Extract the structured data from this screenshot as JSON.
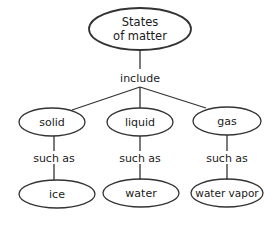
{
  "diagram": {
    "root": {
      "label_line1": "States",
      "label_line2": "of matter"
    },
    "root_link": "include",
    "categories": [
      {
        "label": "solid",
        "link": "such as",
        "example": "ice"
      },
      {
        "label": "liquid",
        "link": "such as",
        "example": "water"
      },
      {
        "label": "gas",
        "link": "such as",
        "example": "water vapor"
      }
    ],
    "colors": {
      "stroke": "#333333",
      "text": "#1a1a1a",
      "background": "#ffffff"
    }
  }
}
